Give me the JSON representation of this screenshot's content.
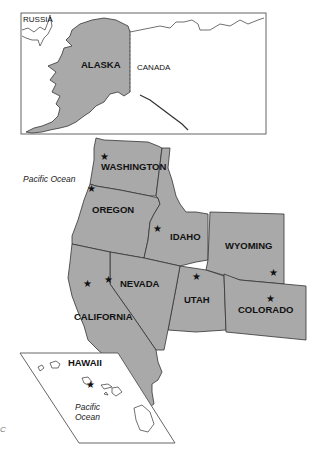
{
  "map": {
    "title": "Western United States",
    "colors": {
      "land": "#a9a9a9",
      "border": "#333333",
      "background": "#ffffff"
    },
    "alaska_inset": {
      "labels": {
        "russia": "RUSSIA",
        "canada": "CANADA",
        "alaska": "ALASKA"
      }
    },
    "states": [
      {
        "name": "WASHINGTON",
        "has_capital_star": true
      },
      {
        "name": "OREGON",
        "has_capital_star": true
      },
      {
        "name": "IDAHO",
        "has_capital_star": true
      },
      {
        "name": "WYOMING",
        "has_capital_star": true
      },
      {
        "name": "NEVADA",
        "has_capital_star": true
      },
      {
        "name": "UTAH",
        "has_capital_star": true
      },
      {
        "name": "COLORADO",
        "has_capital_star": true
      },
      {
        "name": "CALIFORNIA",
        "has_capital_star": true
      }
    ],
    "hawaii_inset": {
      "label": "HAWAII",
      "ocean_line1": "Pacific",
      "ocean_line2": "Ocean"
    },
    "ocean_label": "Pacific Ocean",
    "capital_symbol": "★",
    "margin_mark": "C"
  }
}
